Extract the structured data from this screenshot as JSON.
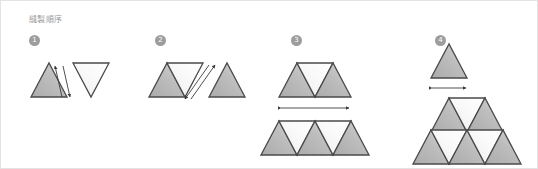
{
  "figure": {
    "title": "縫製順序",
    "background_color": "#ffffff",
    "border_color": "#e3e3e3",
    "title_color": "#9a9a9a"
  },
  "palette": {
    "triangle_gray_fill": "#b5b5b5",
    "triangle_gray_fill_light": "#d6d6d6",
    "triangle_white_fill": "#f7f7f7",
    "triangle_white_fill_light": "#ffffff",
    "stroke_color": "#4a4a4a",
    "arrow_color": "#3c3c3c",
    "badge_color": "#9d9d9d",
    "badge_text_color": "#ffffff"
  },
  "steps": [
    {
      "number": "1",
      "badge_label": "1",
      "name": "step-1",
      "description": "Join one gray upward triangle to one light inverted triangle",
      "pieces": [
        {
          "shape": "triangle-up",
          "fill": "gray"
        },
        {
          "shape": "triangle-down",
          "fill": "light"
        }
      ],
      "arrows": [
        {
          "type": "single",
          "direction": "up"
        },
        {
          "type": "single",
          "direction": "down"
        }
      ]
    },
    {
      "number": "2",
      "badge_label": "2",
      "name": "step-2",
      "description": "Add a second gray upward triangle to the joined pair",
      "pieces": [
        {
          "shape": "triangle-up",
          "fill": "gray"
        },
        {
          "shape": "triangle-down",
          "fill": "light"
        },
        {
          "shape": "triangle-up",
          "fill": "gray"
        }
      ],
      "arrows": [
        {
          "type": "single",
          "direction": "up"
        },
        {
          "type": "single",
          "direction": "down"
        }
      ]
    },
    {
      "number": "3",
      "badge_label": "3",
      "name": "step-3",
      "description": "Sew the three-piece strip onto the five-piece strip, matching widths",
      "rows": [
        {
          "triangles": 3,
          "up": 2,
          "down": 1
        },
        {
          "triangles": 5,
          "up": 3,
          "down": 2
        }
      ],
      "arrows": [
        {
          "type": "double",
          "direction": "horizontal",
          "meaning": "match seam width"
        }
      ]
    },
    {
      "number": "4",
      "badge_label": "4",
      "name": "step-4",
      "description": "Attach the single top triangle to the assembled pyramid",
      "rows": [
        {
          "triangles": 1,
          "up": 1,
          "down": 0
        },
        {
          "triangles": 3,
          "up": 2,
          "down": 1
        },
        {
          "triangles": 5,
          "up": 3,
          "down": 2
        }
      ],
      "arrows": [
        {
          "type": "double",
          "direction": "horizontal",
          "meaning": "match seam width"
        }
      ]
    }
  ]
}
